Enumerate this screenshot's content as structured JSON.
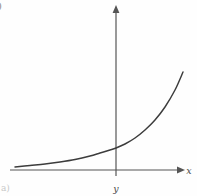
{
  "figure": {
    "panel_label_top": ")",
    "panel_label_bottom": "a)",
    "background_color": "#fefefe",
    "ink_color": "#3c3c3c",
    "axis_color": "#555555"
  },
  "axes": {
    "x_label": "x",
    "y_label": "y",
    "x_axis_name": "horizontal-axis",
    "y_axis_name": "vertical-axis",
    "x_arrow_icon": "arrow-right-icon",
    "y_arrow_icon": "arrow-up-icon"
  },
  "chart_data": {
    "type": "line",
    "title": "",
    "xlabel": "x",
    "ylabel": "y",
    "grid": false,
    "legend": null,
    "axis_origin_px": {
      "x": 116,
      "y": 170
    },
    "x_axis_extent_px": {
      "start": 10,
      "end": 180
    },
    "y_axis_extent_px": {
      "top": 8,
      "bottom": 176
    },
    "series": [
      {
        "name": "exponential-curve",
        "x": [
          15,
          30,
          45,
          60,
          75,
          90,
          100,
          110,
          116,
          125,
          135,
          145,
          155,
          165,
          175,
          183
        ],
        "y": [
          167,
          165.5,
          164,
          162,
          159.5,
          156,
          153,
          150,
          148,
          144,
          138,
          130,
          120,
          107,
          90,
          72
        ]
      }
    ],
    "xlim": [
      10,
      190
    ],
    "ylim": [
      176,
      8
    ]
  }
}
